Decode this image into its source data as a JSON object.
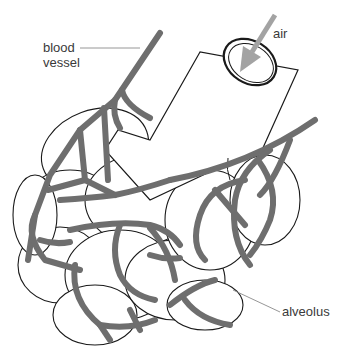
{
  "diagram": {
    "labels": {
      "blood_vessel_line1": "blood",
      "blood_vessel_line2": "vessel",
      "air": "air",
      "alveolus": "alveolus"
    },
    "colors": {
      "background": "#ffffff",
      "blood_vessel": "#6e6e6e",
      "outline": "#1a1a1a",
      "air_arrow": "#a3a3a3",
      "leader_line": "#8a8a8a",
      "label_text": "#3a3a3a"
    }
  }
}
